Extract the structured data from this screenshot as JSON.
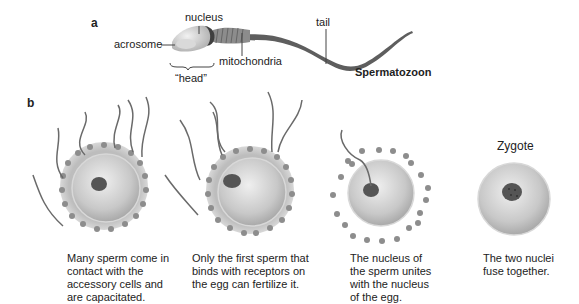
{
  "panel_a": {
    "letter": "a",
    "labels": {
      "nucleus": "nucleus",
      "acrosome": "acrosome",
      "mitochondria": "mitochondria",
      "head": "“head”",
      "tail": "tail",
      "title": "Spermatozoon"
    }
  },
  "panel_b": {
    "letter": "b",
    "stages": [
      {
        "caption": "Many sperm come in contact with the accessory cells and are capacitated."
      },
      {
        "caption": "Only the first sperm that binds with receptors on the egg can fertilize it."
      },
      {
        "caption": "The nucleus of the sperm unites with the nucleus of the egg."
      },
      {
        "title": "Zygote",
        "caption": "The two nuclei fuse together."
      }
    ]
  },
  "colors": {
    "egg_fill": "#c9c9c9",
    "egg_highlight": "#ececec",
    "accessory_cells": "#8a8a8a",
    "nucleus": "#555555",
    "sperm": "#6a6a6a"
  }
}
